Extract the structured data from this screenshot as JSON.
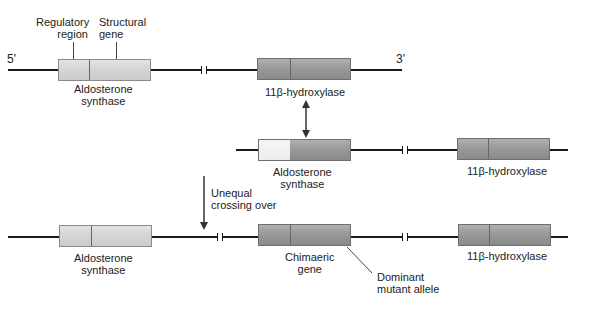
{
  "labels": {
    "five_prime": "5'",
    "three_prime": "3'",
    "regulatory_region": [
      "Regulatory",
      "region"
    ],
    "structural_gene": [
      "Structural",
      "gene"
    ],
    "row1": {
      "gene1": [
        "Aldosterone",
        "synthase"
      ],
      "gene2": "11β-hydroxylase"
    },
    "row2": {
      "gene1": [
        "Aldosterone",
        "synthase"
      ],
      "gene2": "11β-hydroxylase"
    },
    "crossing_over": [
      "Unequal",
      "crossing over"
    ],
    "row3": {
      "gene1": [
        "Aldosterone",
        "synthase"
      ],
      "gene2": [
        "Chimaeric",
        "gene"
      ],
      "gene3": "11β-hydroxylase",
      "annotation": [
        "Dominant",
        "mutant allele"
      ]
    }
  },
  "colors": {
    "aldosterone_light": "#d6d6d6",
    "hydroxylase_dark": "#9a9a9a",
    "regulatory_white": "#f0f0f0",
    "line": "#1a1a1a"
  }
}
